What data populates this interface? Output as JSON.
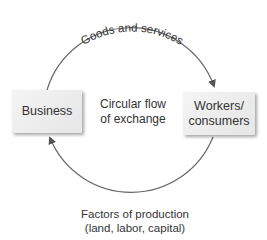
{
  "diagram": {
    "top_label": "Goods and services",
    "center_label_line1": "Circular flow",
    "center_label_line2": "of exchange",
    "left_node": "Business",
    "right_node_line1": "Workers/",
    "right_node_line2": "consumers",
    "bottom_label_line1": "Factors of production",
    "bottom_label_line2": "(land, labor, capital)",
    "arrow_color": "#666666",
    "box_color": "#eeeeee"
  }
}
